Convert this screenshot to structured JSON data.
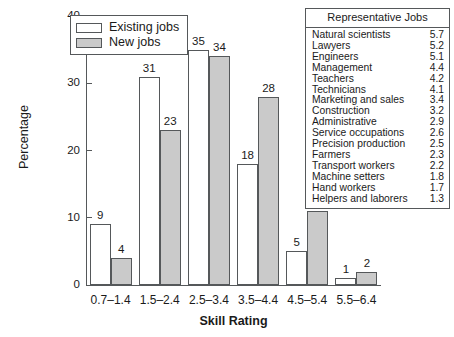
{
  "chart_data": {
    "type": "bar",
    "title": "",
    "xlabel": "Skill Rating",
    "ylabel": "Percentage",
    "categories": [
      "0.7–1.4",
      "1.5–2.4",
      "2.5–3.4",
      "3.5–4.4",
      "4.5–5.4",
      "5.5–6.4"
    ],
    "series": [
      {
        "name": "Existing jobs",
        "values": [
          9,
          31,
          35,
          18,
          5,
          1
        ],
        "color": "#ffffff"
      },
      {
        "name": "New jobs",
        "values": [
          4,
          23,
          34,
          28,
          11,
          2
        ],
        "color": "#cacaca"
      }
    ],
    "ylim": [
      0,
      40
    ],
    "yticks": [
      0,
      10,
      20,
      30,
      40
    ],
    "grid": false,
    "legend_position": "top-left"
  },
  "legend": {
    "items": [
      {
        "label": "Existing jobs",
        "swatch": "existing"
      },
      {
        "label": "New jobs",
        "swatch": "newjobs"
      }
    ]
  },
  "jobs_table": {
    "header": "Representative Jobs",
    "rows": [
      {
        "name": "Natural scientists",
        "value": "5.7"
      },
      {
        "name": "Lawyers",
        "value": "5.2"
      },
      {
        "name": "Engineers",
        "value": "5.1"
      },
      {
        "name": "Management",
        "value": "4.4"
      },
      {
        "name": "Teachers",
        "value": "4.2"
      },
      {
        "name": "Technicians",
        "value": "4.1"
      },
      {
        "name": "Marketing and sales",
        "value": "3.4"
      },
      {
        "name": "Construction",
        "value": "3.2"
      },
      {
        "name": "Administrative",
        "value": "2.9"
      },
      {
        "name": "Service occupations",
        "value": "2.6"
      },
      {
        "name": "Precision production",
        "value": "2.5"
      },
      {
        "name": "Farmers",
        "value": "2.3"
      },
      {
        "name": "Transport workers",
        "value": "2.2"
      },
      {
        "name": "Machine setters",
        "value": "1.8"
      },
      {
        "name": "Hand workers",
        "value": "1.7"
      },
      {
        "name": "Helpers and laborers",
        "value": "1.3"
      }
    ]
  },
  "caption": ""
}
